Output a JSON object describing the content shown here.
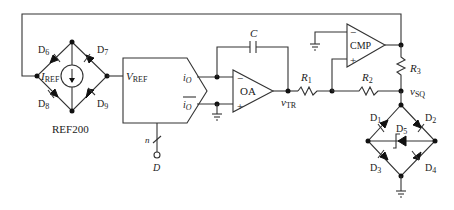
{
  "diagram": {
    "type": "circuit-schematic"
  },
  "ref200": {
    "label": "REF200",
    "current_label": "I",
    "current_sub": "REF",
    "diodes": [
      "D6",
      "D7",
      "D8",
      "D9"
    ]
  },
  "dac": {
    "input_label": "V",
    "input_sub": "REF",
    "out_pos": "i",
    "out_pos_sub": "O",
    "out_neg": "i",
    "out_neg_sub": "O",
    "bus_width": "n",
    "digital_input": "D"
  },
  "integrator": {
    "opamp_label": "OA",
    "capacitor_label": "C",
    "minus": "−",
    "plus": "+",
    "output_node": "v",
    "output_sub": "TR"
  },
  "comparator": {
    "label": "CMP",
    "minus": "−",
    "plus": "+"
  },
  "resistors": {
    "r1": {
      "label": "R",
      "sub": "1"
    },
    "r2": {
      "label": "R",
      "sub": "2"
    },
    "r3": {
      "label": "R",
      "sub": "3"
    }
  },
  "limiter": {
    "output_node": "v",
    "output_sub": "SQ",
    "diodes": [
      "D1",
      "D2",
      "D5",
      "D3",
      "D4"
    ]
  },
  "colors": {
    "line": "#333333",
    "background": "#ffffff"
  }
}
